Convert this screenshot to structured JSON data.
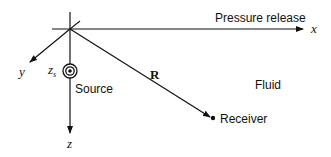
{
  "diagram": {
    "surface_label": "Pressure release",
    "medium_label": "Fluid",
    "source_label": "Source",
    "receiver_label": "Receiver",
    "range_label": "R",
    "source_depth_label": "z",
    "source_depth_sub": "s",
    "axes": {
      "x": "x",
      "y": "y",
      "z": "z"
    },
    "colors": {
      "line": "#111111",
      "background": "#ffffff"
    }
  }
}
